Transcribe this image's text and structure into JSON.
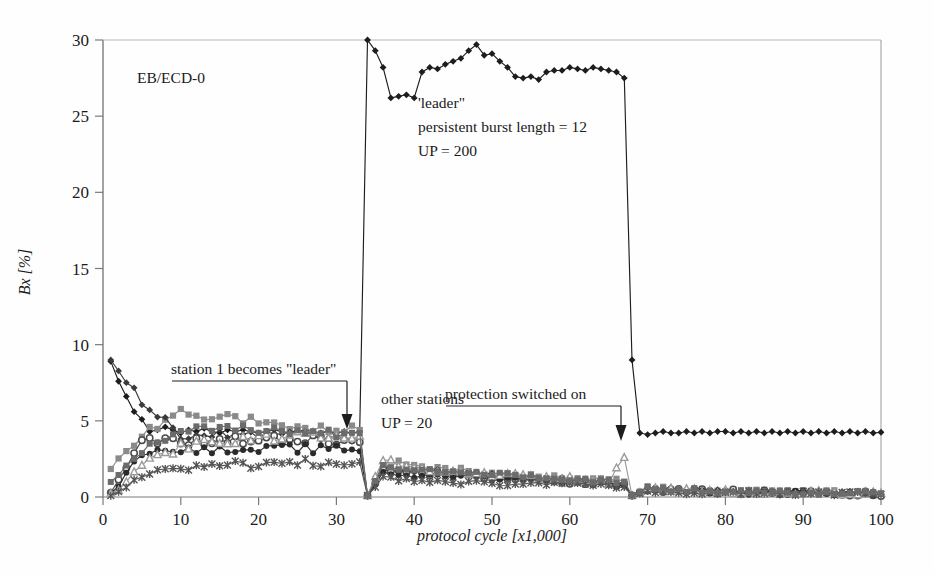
{
  "figure": {
    "corner_label": "EB/ECD-0",
    "background": "#fefefe",
    "axis_color": "#6e6e6e"
  },
  "annotations": {
    "leader_block": {
      "line1": "'leader\"",
      "line2": "persistent burst length = 12",
      "line3": "UP = 200"
    },
    "others_block": {
      "line1": "other stations",
      "line2": "UP = 20"
    },
    "arrow_left_label": "station 1 becomes \"leader\"",
    "arrow_right_label": "protection switched on"
  },
  "chart_data": {
    "type": "line",
    "title": "EB/ECD-0",
    "xlabel": "protocol cycle [x1,000]",
    "ylabel": "Bx [%]",
    "xlim": [
      0,
      100
    ],
    "ylim": [
      0,
      30
    ],
    "xticks": [
      0,
      10,
      20,
      30,
      40,
      50,
      60,
      70,
      80,
      90,
      100
    ],
    "yticks": [
      0,
      5,
      10,
      15,
      20,
      25,
      30
    ],
    "grid": false,
    "legend": "none",
    "x_step": 1,
    "events": [
      {
        "label": "station 1 becomes \"leader\"",
        "x": 33
      },
      {
        "label": "protection switched on",
        "x": 67
      }
    ],
    "series": [
      {
        "name": "station 1 (leader)",
        "marker": "diamond",
        "color": "#1d1d1d",
        "x": [
          1,
          2,
          3,
          4,
          5,
          6,
          7,
          8,
          9,
          10,
          11,
          12,
          13,
          14,
          15,
          16,
          17,
          18,
          19,
          20,
          21,
          22,
          23,
          24,
          25,
          26,
          27,
          28,
          29,
          30,
          31,
          32,
          33,
          34,
          35,
          36,
          37,
          38,
          39,
          40,
          41,
          42,
          43,
          44,
          45,
          46,
          47,
          48,
          49,
          50,
          51,
          52,
          53,
          54,
          55,
          56,
          57,
          58,
          59,
          60,
          61,
          62,
          63,
          64,
          65,
          66,
          67,
          68,
          69,
          70,
          71,
          72,
          73,
          74,
          75,
          76,
          77,
          78,
          79,
          80,
          81,
          82,
          83,
          84,
          85,
          86,
          87,
          88,
          89,
          90,
          91,
          92,
          93,
          94,
          95,
          96,
          97,
          98,
          99,
          100
        ],
        "y": [
          8.9,
          7.6,
          6.6,
          5.6,
          5.1,
          4.3,
          4.4,
          4.6,
          4.4,
          4.2,
          4.4,
          4.3,
          4.5,
          4.3,
          4.2,
          4.4,
          4.3,
          4.4,
          4.3,
          4.2,
          4.3,
          4.4,
          4.3,
          4.2,
          4.3,
          4.4,
          4.3,
          4.2,
          4.3,
          4.2,
          4.3,
          4.2,
          4.3,
          30.0,
          29.3,
          28.2,
          26.2,
          26.3,
          26.4,
          26.2,
          27.9,
          28.2,
          28.1,
          28.4,
          28.6,
          28.8,
          29.3,
          29.7,
          29.0,
          29.1,
          28.6,
          28.2,
          27.6,
          27.5,
          27.6,
          27.4,
          27.9,
          28.0,
          28.0,
          28.2,
          28.1,
          28.0,
          28.2,
          28.1,
          28.0,
          27.9,
          27.5,
          9.0,
          4.2,
          4.1,
          4.2,
          4.3,
          4.2,
          4.2,
          4.3,
          4.2,
          4.3,
          4.2,
          4.3,
          4.3,
          4.2,
          4.3,
          4.2,
          4.3,
          4.2,
          4.3,
          4.2,
          4.3,
          4.2,
          4.3,
          4.2,
          4.3,
          4.2,
          4.3,
          4.2,
          4.3,
          4.2,
          4.3,
          4.2,
          4.25
        ]
      },
      {
        "name": "station 2",
        "marker": "square",
        "color": "#8a8a8a",
        "x": [
          1,
          5,
          10,
          15,
          20,
          25,
          30,
          33,
          34,
          36,
          40,
          45,
          50,
          55,
          60,
          65,
          67,
          68,
          70,
          75,
          80,
          85,
          90,
          95,
          100
        ],
        "y": [
          1.7,
          4.1,
          5.5,
          5.3,
          4.9,
          4.6,
          4.5,
          4.4,
          0.1,
          2.2,
          2.0,
          1.8,
          1.6,
          1.4,
          1.3,
          1.1,
          1.0,
          0.1,
          0.6,
          0.5,
          0.4,
          0.35,
          0.3,
          0.3,
          0.25
        ]
      },
      {
        "name": "station 3",
        "marker": "diamond",
        "color": "#3a3a3a",
        "x": [
          1,
          5,
          10,
          15,
          20,
          25,
          30,
          33,
          34,
          36,
          40,
          45,
          50,
          55,
          60,
          65,
          67,
          68,
          70,
          75,
          80,
          85,
          90,
          95,
          100
        ],
        "y": [
          8.7,
          6.3,
          4.1,
          4.2,
          4.0,
          4.1,
          4.0,
          3.9,
          0.1,
          1.9,
          1.7,
          1.6,
          1.4,
          1.2,
          1.1,
          1.0,
          0.9,
          0.1,
          0.5,
          0.45,
          0.4,
          0.3,
          0.3,
          0.25,
          0.25
        ]
      },
      {
        "name": "station 4",
        "marker": "circle-open",
        "color": "#4a4a4a",
        "x": [
          1,
          5,
          10,
          15,
          20,
          25,
          30,
          33,
          34,
          36,
          40,
          45,
          50,
          55,
          60,
          65,
          67,
          68,
          70,
          75,
          80,
          85,
          90,
          95,
          100
        ],
        "y": [
          0.2,
          3.6,
          3.6,
          3.7,
          3.8,
          3.8,
          3.7,
          3.6,
          0.1,
          1.7,
          1.6,
          1.5,
          1.3,
          1.2,
          1.0,
          0.9,
          0.85,
          0.1,
          0.5,
          0.4,
          0.35,
          0.3,
          0.3,
          0.25,
          0.2
        ]
      },
      {
        "name": "station 5",
        "marker": "circle-filled",
        "color": "#2b2b2b",
        "x": [
          1,
          5,
          10,
          15,
          20,
          25,
          30,
          33,
          34,
          36,
          40,
          45,
          50,
          55,
          60,
          65,
          67,
          68,
          70,
          75,
          80,
          85,
          90,
          95,
          100
        ],
        "y": [
          0.1,
          2.8,
          3.0,
          3.1,
          3.2,
          3.2,
          3.1,
          3.0,
          0.1,
          1.5,
          1.4,
          1.3,
          1.2,
          1.1,
          0.95,
          0.85,
          0.8,
          0.1,
          0.45,
          0.4,
          0.3,
          0.3,
          0.25,
          0.25,
          0.2
        ]
      },
      {
        "name": "station 6",
        "marker": "triangle-open",
        "color": "#9a9a9a",
        "x": [
          1,
          5,
          10,
          15,
          20,
          25,
          30,
          33,
          34,
          36,
          40,
          45,
          50,
          55,
          60,
          65,
          67,
          68,
          70,
          75,
          80,
          85,
          90,
          95,
          100
        ],
        "y": [
          0.1,
          2.0,
          3.3,
          3.6,
          3.8,
          4.0,
          4.1,
          4.0,
          0.1,
          2.6,
          1.9,
          1.7,
          1.5,
          1.3,
          1.2,
          1.0,
          2.6,
          0.1,
          0.5,
          0.4,
          0.35,
          0.3,
          0.3,
          0.25,
          0.2
        ]
      },
      {
        "name": "station 7",
        "marker": "cross",
        "color": "#555555",
        "x": [
          1,
          5,
          10,
          15,
          20,
          25,
          30,
          33,
          34,
          36,
          40,
          45,
          50,
          55,
          60,
          65,
          67,
          68,
          70,
          75,
          80,
          85,
          90,
          95,
          100
        ],
        "y": [
          0.1,
          1.4,
          2.0,
          2.1,
          2.2,
          2.3,
          2.3,
          2.3,
          0.1,
          1.2,
          1.1,
          1.0,
          0.9,
          0.85,
          0.8,
          0.7,
          0.65,
          0.1,
          0.35,
          0.3,
          0.3,
          0.25,
          0.25,
          0.2,
          0.2
        ]
      },
      {
        "name": "station 8",
        "marker": "square-filled",
        "color": "#6b6b6b",
        "x": [
          1,
          5,
          10,
          15,
          20,
          25,
          30,
          33,
          34,
          36,
          40,
          45,
          50,
          55,
          60,
          65,
          67,
          68,
          70,
          75,
          80,
          85,
          90,
          95,
          100
        ],
        "y": [
          1.0,
          3.1,
          4.4,
          4.5,
          4.4,
          4.3,
          4.2,
          4.2,
          0.1,
          2.0,
          1.8,
          1.65,
          1.5,
          1.35,
          1.2,
          1.05,
          1.0,
          0.1,
          0.55,
          0.45,
          0.4,
          0.35,
          0.3,
          0.3,
          0.25
        ]
      }
    ]
  }
}
